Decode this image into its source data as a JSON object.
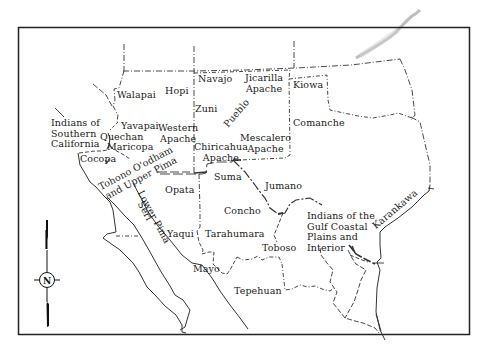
{
  "map": {
    "type": "ethnographic region map",
    "region": "Greater Southwest / Northern Mexico",
    "frame_color": "#222222",
    "line_color": "#333333",
    "background": "#ffffff"
  },
  "compass": {
    "label": "N"
  },
  "groups": [
    {
      "id": "walapai",
      "label": "Walapai"
    },
    {
      "id": "hopi",
      "label": "Hopi"
    },
    {
      "id": "navajo",
      "label": "Navajo"
    },
    {
      "id": "jicarilla",
      "label": "Jicarilla\nApache"
    },
    {
      "id": "kiowa",
      "label": "Kiowa"
    },
    {
      "id": "zuni",
      "label": "Zuni"
    },
    {
      "id": "pueblo",
      "label": "Pueblo"
    },
    {
      "id": "southern_california",
      "label": "Indians of\nSouthern\nCalifornia"
    },
    {
      "id": "yavapai",
      "label": "Yavapai"
    },
    {
      "id": "western_apache",
      "label": "Western\nApache"
    },
    {
      "id": "comanche",
      "label": "Comanche"
    },
    {
      "id": "quechan",
      "label": "Quechan"
    },
    {
      "id": "maricopa",
      "label": "Maricopa"
    },
    {
      "id": "mescalero",
      "label": "Mescalero\nApache"
    },
    {
      "id": "chiricahua",
      "label": "Chiricahua\nApache"
    },
    {
      "id": "cocopa",
      "label": "Cocopa"
    },
    {
      "id": "tohono",
      "label": "Tohono O'odham\nand Upper Pima"
    },
    {
      "id": "suma",
      "label": "Suma"
    },
    {
      "id": "jumano",
      "label": "Jumano"
    },
    {
      "id": "lower_pima",
      "label": "Lower Pima"
    },
    {
      "id": "seri",
      "label": "Seri"
    },
    {
      "id": "opata",
      "label": "Opata"
    },
    {
      "id": "concho",
      "label": "Concho"
    },
    {
      "id": "gulf_coastal",
      "label": "Indians of the\nGulf Coastal\nPlains and\nInterior"
    },
    {
      "id": "karankawa",
      "label": "Karankawa"
    },
    {
      "id": "yaqui",
      "label": "Yaqui"
    },
    {
      "id": "tarahumara",
      "label": "Tarahumara"
    },
    {
      "id": "toboso",
      "label": "Toboso"
    },
    {
      "id": "mayo",
      "label": "Mayo"
    },
    {
      "id": "tepehuan",
      "label": "Tepehuan"
    }
  ]
}
